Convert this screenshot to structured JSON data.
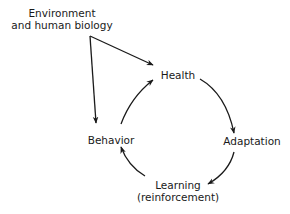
{
  "diagram": {
    "type": "cycle-diagram",
    "colors": {
      "background": "#ffffff",
      "ink": "#1a1a1a"
    },
    "external_influence": {
      "label_line1": "Environment",
      "label_line2": "and human biology",
      "arrows_to": [
        "Health",
        "Behavior"
      ]
    },
    "cycle": {
      "direction": "clockwise",
      "nodes": [
        {
          "id": "health",
          "label": "Health"
        },
        {
          "id": "adaptation",
          "label": "Adaptation"
        },
        {
          "id": "learning",
          "label_line1": "Learning",
          "label_line2": "(reinforcement)"
        },
        {
          "id": "behavior",
          "label": "Behavior"
        }
      ],
      "edges": [
        {
          "from": "Health",
          "to": "Adaptation"
        },
        {
          "from": "Adaptation",
          "to": "Learning"
        },
        {
          "from": "Learning",
          "to": "Behavior"
        },
        {
          "from": "Behavior",
          "to": "Health"
        }
      ]
    }
  }
}
